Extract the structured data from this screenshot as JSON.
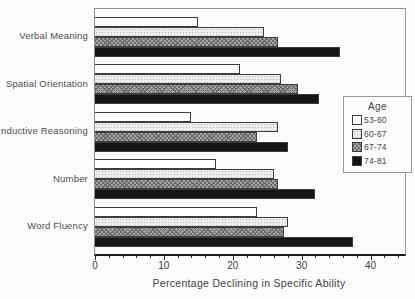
{
  "chart_data": {
    "type": "bar",
    "orientation": "horizontal",
    "title": "",
    "xlabel": "Percentage Declining in Specific Ability",
    "ylabel": "",
    "xlim": [
      0,
      45
    ],
    "xticks": [
      0,
      10,
      20,
      30,
      40
    ],
    "minor_tick_step": 2,
    "grid": false,
    "legend_title": "Age",
    "legend_position": "right",
    "categories": [
      "Verbal Meaning",
      "Spatial Orientation",
      "Inductive Reasoning",
      "Number",
      "Word Fluency"
    ],
    "series": [
      {
        "name": "53-60",
        "style": "white",
        "color": "#ffffff",
        "values": [
          15,
          21,
          14,
          17.5,
          23.5
        ]
      },
      {
        "name": "60-67",
        "style": "light",
        "color": "#ededed",
        "values": [
          24.5,
          27,
          26.5,
          26,
          28
        ]
      },
      {
        "name": "67-74",
        "style": "gray",
        "color": "#a6a6a6",
        "values": [
          26.5,
          29.5,
          23.5,
          26.5,
          27.5
        ]
      },
      {
        "name": "74-81",
        "style": "black",
        "color": "#151515",
        "values": [
          35.5,
          32.5,
          28,
          32,
          37.5
        ]
      }
    ],
    "colors": {
      "frame": "#8f8f8f",
      "axis": "#1c1c1c",
      "text": "#474747",
      "background": "#fcfcfc"
    }
  }
}
